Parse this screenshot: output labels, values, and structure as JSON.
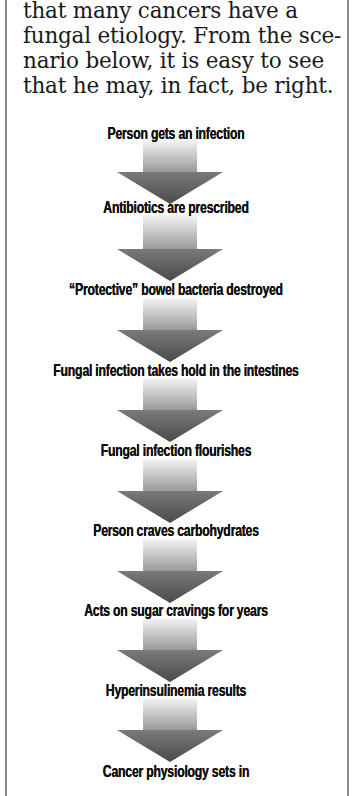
{
  "intro": {
    "lines": [
      "that many cancers have a",
      "fungal etiology. From the sce-",
      "nario below, it is easy to see",
      "that he may, in fact, be right."
    ]
  },
  "flowchart": {
    "steps": [
      {
        "label": "Person gets an infection"
      },
      {
        "label": "Antibiotics are prescribed"
      },
      {
        "label": "“Protective” bowel bacteria destroyed"
      },
      {
        "label": "Fungal infection takes hold in the intestines"
      },
      {
        "label": "Fungal infection flourishes"
      },
      {
        "label": "Person craves carbohydrates"
      },
      {
        "label": "Acts on sugar cravings for years"
      },
      {
        "label": "Hyperinsulinemia results"
      },
      {
        "label": "Cancer physiology sets in"
      }
    ],
    "colors": {
      "arrow_light": "#f2f2f2",
      "arrow_dark": "#6a6a6a",
      "border": "#8a8a8a",
      "text": "#111111"
    }
  }
}
